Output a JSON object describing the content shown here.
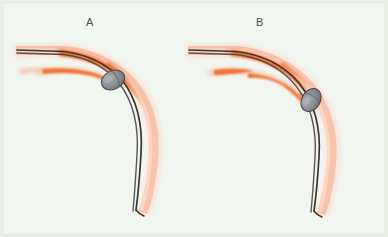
{
  "figure": {
    "kind": "anatomical-illustration",
    "width": 388,
    "height": 237,
    "background_color": "#f2f6f0",
    "border_color": "#e8efe6"
  },
  "panels": [
    {
      "id": "A",
      "label": "A",
      "label_x": 86,
      "label_y": 16,
      "device_position": "proximal to the curve apex",
      "device": {
        "name": "balloon-device",
        "center_x": 113,
        "center_y": 80,
        "rx": 12,
        "ry": 9,
        "rotation_deg": -28,
        "fill_color": "#8e9196",
        "stroke_color": "#4a4a4c"
      },
      "vessel": {
        "name": "artery",
        "wall_color": "#f9c3ab",
        "wall_light_color": "#fcdccb",
        "lumen_line_color": "#3a342f"
      },
      "plaque": {
        "name": "atherosclerotic-plaque",
        "color": "#ef6d2b",
        "soft_color": "#f4battached"
      }
    },
    {
      "id": "B",
      "label": "B",
      "label_x": 256,
      "label_y": 16,
      "device_position": "distal, past the curve apex",
      "device": {
        "name": "balloon-device",
        "center_x": 311,
        "center_y": 100,
        "rx": 12,
        "ry": 9,
        "rotation_deg": -55,
        "fill_color": "#8e9196",
        "stroke_color": "#4a4a4c"
      },
      "vessel": {
        "name": "artery",
        "wall_color": "#f9c3ab",
        "wall_light_color": "#fcdccb",
        "lumen_line_color": "#3a342f"
      },
      "plaque": {
        "name": "atherosclerotic-plaque",
        "color": "#ef6d2b",
        "soft_color": "#f7a882"
      }
    }
  ],
  "colors": {
    "background": "#f2f6f0",
    "border": "#e9efe7",
    "vessel_wall": "#f9c3ab",
    "vessel_wall_light": "#fcdccb",
    "vessel_wall_pale": "#fbe3d6",
    "guidewire": "#3a342f",
    "plaque_orange": "#ef6d2b",
    "plaque_orange_soft": "#f6916a",
    "device_gray": "#8e9196",
    "device_gray_dark": "#6f7378",
    "device_outline": "#4a4a4c",
    "label_text": "#4a4f48"
  }
}
